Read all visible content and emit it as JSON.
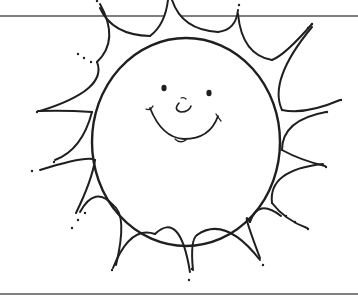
{
  "illustration": {
    "subject": "smiling sun coloring page",
    "style": "black line art on white",
    "colors": {
      "line": "#1f1f1f",
      "background": "#ffffff",
      "rule_line": "#555555"
    },
    "sun": {
      "center": [
        186,
        142
      ],
      "radius_x": 94,
      "radius_y": 104,
      "ray_count": 12
    },
    "face": {
      "eyes": 2,
      "nose": "small curved nose",
      "mouth": "smile"
    }
  }
}
